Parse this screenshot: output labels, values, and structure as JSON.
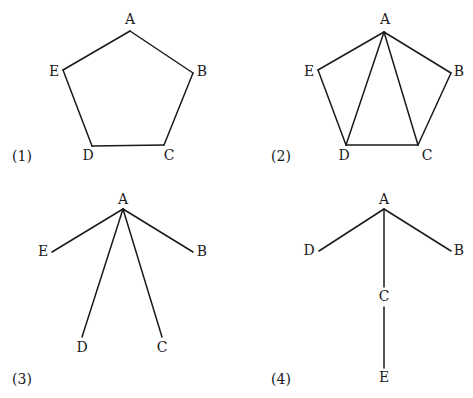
{
  "figures": [
    {
      "id": 1,
      "caption": "(1)",
      "caption_pos": [
        22,
        157
      ],
      "nodes": [
        {
          "name": "A",
          "pos": [
            130,
            31
          ],
          "label_pos": [
            130,
            20
          ]
        },
        {
          "name": "B",
          "pos": [
            193,
            73
          ],
          "label_pos": [
            202,
            72
          ]
        },
        {
          "name": "C",
          "pos": [
            164,
            145
          ],
          "label_pos": [
            169,
            156
          ]
        },
        {
          "name": "D",
          "pos": [
            92,
            146
          ],
          "label_pos": [
            88,
            156
          ]
        },
        {
          "name": "E",
          "pos": [
            63,
            70
          ],
          "label_pos": [
            54,
            72
          ]
        }
      ],
      "edges": [
        [
          "A",
          "B"
        ],
        [
          "B",
          "C"
        ],
        [
          "C",
          "D"
        ],
        [
          "D",
          "E"
        ],
        [
          "E",
          "A"
        ]
      ]
    },
    {
      "id": 2,
      "caption": "(2)",
      "caption_pos": [
        281,
        157
      ],
      "nodes": [
        {
          "name": "A",
          "pos": [
            384,
            32
          ],
          "label_pos": [
            385,
            20
          ]
        },
        {
          "name": "B",
          "pos": [
            451,
            73
          ],
          "label_pos": [
            459,
            72
          ]
        },
        {
          "name": "C",
          "pos": [
            418,
            145
          ],
          "label_pos": [
            427,
            156
          ]
        },
        {
          "name": "D",
          "pos": [
            346,
            145
          ],
          "label_pos": [
            344,
            156
          ]
        },
        {
          "name": "E",
          "pos": [
            318,
            70
          ],
          "label_pos": [
            309,
            72
          ]
        }
      ],
      "edges": [
        [
          "A",
          "B"
        ],
        [
          "B",
          "C"
        ],
        [
          "C",
          "D"
        ],
        [
          "D",
          "E"
        ],
        [
          "E",
          "A"
        ],
        [
          "A",
          "D"
        ],
        [
          "A",
          "C"
        ]
      ]
    },
    {
      "id": 3,
      "caption": "(3)",
      "caption_pos": [
        22,
        380
      ],
      "nodes": [
        {
          "name": "A",
          "pos": [
            123,
            209
          ],
          "label_pos": [
            123,
            200
          ]
        },
        {
          "name": "B",
          "pos": [
            193,
            252
          ],
          "label_pos": [
            202,
            252
          ]
        },
        {
          "name": "C",
          "pos": [
            162,
            337
          ],
          "label_pos": [
            162,
            348
          ]
        },
        {
          "name": "D",
          "pos": [
            82,
            337
          ],
          "label_pos": [
            82,
            348
          ]
        },
        {
          "name": "E",
          "pos": [
            52,
            252
          ],
          "label_pos": [
            43,
            252
          ]
        }
      ],
      "edges": [
        [
          "A",
          "B"
        ],
        [
          "A",
          "C"
        ],
        [
          "A",
          "D"
        ],
        [
          "A",
          "E"
        ]
      ]
    },
    {
      "id": 4,
      "caption": "(4)",
      "caption_pos": [
        281,
        380
      ],
      "nodes": [
        {
          "name": "A",
          "pos": [
            384,
            209
          ],
          "label_pos": [
            384,
            200
          ]
        },
        {
          "name": "B",
          "pos": [
            451,
            251
          ],
          "label_pos": [
            459,
            251
          ]
        },
        {
          "name": "C",
          "pos": [
            384,
            297
          ],
          "label_pos": [
            384,
            297
          ]
        },
        {
          "name": "D",
          "pos": [
            319,
            251
          ],
          "label_pos": [
            309,
            251
          ]
        },
        {
          "name": "E",
          "pos": [
            384,
            368
          ],
          "label_pos": [
            384,
            378
          ]
        }
      ],
      "edges": [
        [
          "A",
          "B"
        ],
        [
          "A",
          "D"
        ],
        [
          "A",
          "C"
        ],
        [
          "C",
          "E"
        ]
      ],
      "edge_segments": [
        {
          "from": "A",
          "to": "C",
          "start": [
            384,
            209
          ],
          "end": [
            384,
            287
          ]
        },
        {
          "from": "C",
          "to": "E",
          "start": [
            384,
            307
          ],
          "end": [
            384,
            368
          ]
        }
      ]
    }
  ]
}
